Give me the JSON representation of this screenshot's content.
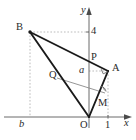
{
  "figure": {
    "type": "geometry-diagram",
    "background": "#ffffff",
    "stroke_main": "#1a1a1a",
    "stroke_thin": "#6e6e6e",
    "stroke_dotted": "#b0b0b0",
    "axis_color": "#6a6a6a"
  },
  "axes": {
    "x_label": "x",
    "y_label": "y",
    "x_tick_label": "1",
    "y_tick_label": "4",
    "origin_label": "O",
    "neg_x_label": "b"
  },
  "points": {
    "B": "B",
    "A": "A",
    "P": "P",
    "Q": "Q",
    "M": "M",
    "a": "a"
  },
  "geometry": {
    "origin": {
      "x": 89,
      "y": 117
    },
    "B": {
      "x": 30,
      "y": 32
    },
    "A": {
      "x": 108,
      "y": 71
    },
    "P": {
      "x": 89,
      "y": 61
    },
    "Q": {
      "x": 57,
      "y": 78
    },
    "M": {
      "x": 103,
      "y": 96
    },
    "tick_one": {
      "x": 108,
      "y": 117
    },
    "tick_four": {
      "x": 89,
      "y": 32
    },
    "tick_b": {
      "x": 30,
      "y": 117
    }
  },
  "markers": {
    "right_angle_at_A": "right-angle-square",
    "angle_arc_at_M": "angle-arc"
  }
}
